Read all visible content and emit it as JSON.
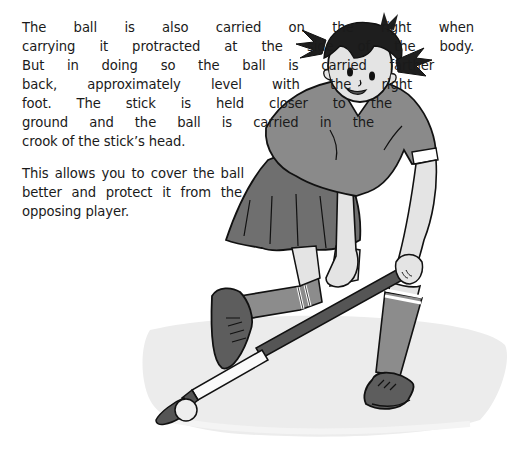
{
  "paragraphs": [
    {
      "lines": [
        "The ball is also carried on the right when",
        "carrying it protracted at the side of the body.",
        "But in doing so the ball is carried farther",
        "back, approximately level with the right",
        "foot. The stick is held closer to the",
        "ground and the ball is carried in the",
        "crook of the stick’s head."
      ]
    },
    {
      "lines": [
        "This allows you to cover the ball",
        "better and protect it from the",
        "opposing player."
      ]
    }
  ],
  "illustration": {
    "subject": "girl-playing-field-hockey",
    "colors": {
      "outline": "#111111",
      "shirt": "#8a8a8a",
      "skirt": "#6f6f6f",
      "skin": "#e4e4e4",
      "hair": "#1e1e1e",
      "socks": "#8c8c8c",
      "shoes": "#5d5d5d",
      "ground_shadow": "#e9e9e9",
      "ball": "#eeeeee"
    }
  }
}
